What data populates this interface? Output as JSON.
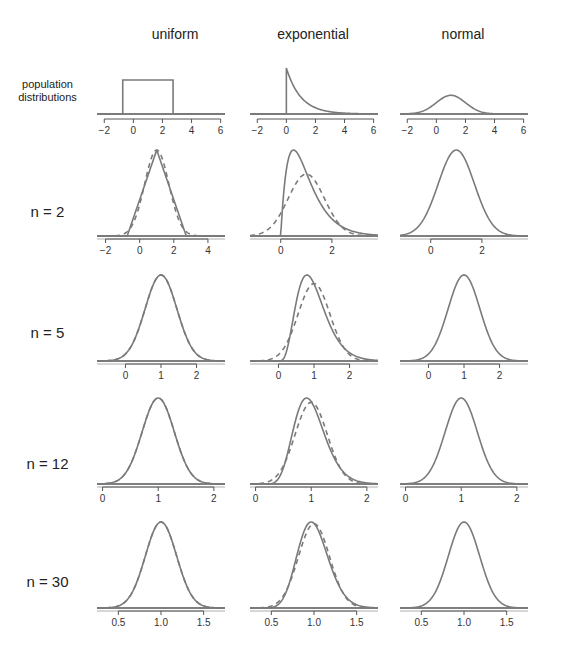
{
  "figure": {
    "column_titles": [
      "uniform",
      "exponential",
      "normal"
    ],
    "row_labels": [
      "population\ndistributions",
      "n = 2",
      "n = 5",
      "n = 12",
      "n = 30"
    ],
    "line_color": "#7a7a7a",
    "axis_color": "#555555"
  },
  "chart_data": {
    "type": "line",
    "columns": [
      "uniform",
      "exponential",
      "normal"
    ],
    "rows": [
      "population distributions",
      "n = 2",
      "n = 5",
      "n = 12",
      "n = 30"
    ],
    "legend": {
      "solid": "sampling distribution of the mean",
      "dashed": "normal approximation"
    },
    "panels": [
      {
        "row": "population distributions",
        "column": "uniform",
        "xlim": [
          -2.5,
          6.3
        ],
        "ticks": [
          -2,
          0,
          2,
          4,
          6
        ],
        "curve": "uniform(-0.73, 2.73)"
      },
      {
        "row": "population distributions",
        "column": "exponential",
        "xlim": [
          -2.5,
          6.3
        ],
        "ticks": [
          -2,
          0,
          2,
          4,
          6
        ],
        "curve": "exponential(rate=1)"
      },
      {
        "row": "population distributions",
        "column": "normal",
        "xlim": [
          -2.5,
          6.3
        ],
        "ticks": [
          -2,
          0,
          2,
          4,
          6
        ],
        "curve": "normal(mean=1, sd=1)"
      },
      {
        "row": "n = 2",
        "column": "uniform",
        "xlim": [
          -2.5,
          5
        ],
        "ticks": [
          -2,
          0,
          2,
          4
        ],
        "mean": 1,
        "sd": 0.707
      },
      {
        "row": "n = 2",
        "column": "exponential",
        "xlim": [
          -1.2,
          3.8
        ],
        "ticks": [
          0,
          2
        ],
        "mean": 1,
        "sd": 0.707
      },
      {
        "row": "n = 2",
        "column": "normal",
        "xlim": [
          -1.2,
          3.8
        ],
        "ticks": [
          0,
          2
        ],
        "mean": 1,
        "sd": 0.707
      },
      {
        "row": "n = 5",
        "column": "uniform",
        "xlim": [
          -0.8,
          2.8
        ],
        "ticks": [
          0,
          1,
          2
        ],
        "mean": 1,
        "sd": 0.447
      },
      {
        "row": "n = 5",
        "column": "exponential",
        "xlim": [
          -0.8,
          2.8
        ],
        "ticks": [
          0,
          1,
          2
        ],
        "mean": 1,
        "sd": 0.447
      },
      {
        "row": "n = 5",
        "column": "normal",
        "xlim": [
          -0.8,
          2.8
        ],
        "ticks": [
          0,
          1,
          2
        ],
        "mean": 1,
        "sd": 0.447
      },
      {
        "row": "n = 12",
        "column": "uniform",
        "xlim": [
          -0.1,
          2.2
        ],
        "ticks": [
          0,
          1,
          2
        ],
        "mean": 1,
        "sd": 0.289
      },
      {
        "row": "n = 12",
        "column": "exponential",
        "xlim": [
          -0.1,
          2.2
        ],
        "ticks": [
          0,
          1,
          2
        ],
        "mean": 1,
        "sd": 0.289
      },
      {
        "row": "n = 12",
        "column": "normal",
        "xlim": [
          -0.1,
          2.2
        ],
        "ticks": [
          0,
          1,
          2
        ],
        "mean": 1,
        "sd": 0.289
      },
      {
        "row": "n = 30",
        "column": "uniform",
        "xlim": [
          0.25,
          1.75
        ],
        "ticks": [
          0.5,
          1.0,
          1.5
        ],
        "tick_labels": [
          "0.5",
          "1.0",
          "1.5"
        ],
        "mean": 1,
        "sd": 0.183
      },
      {
        "row": "n = 30",
        "column": "exponential",
        "xlim": [
          0.25,
          1.75
        ],
        "ticks": [
          0.5,
          1.0,
          1.5
        ],
        "tick_labels": [
          "0.5",
          "1.0",
          "1.5"
        ],
        "mean": 1,
        "sd": 0.183
      },
      {
        "row": "n = 30",
        "column": "normal",
        "xlim": [
          0.25,
          1.75
        ],
        "ticks": [
          0.5,
          1.0,
          1.5
        ],
        "tick_labels": [
          "0.5",
          "1.0",
          "1.5"
        ],
        "mean": 1,
        "sd": 0.183
      }
    ]
  }
}
